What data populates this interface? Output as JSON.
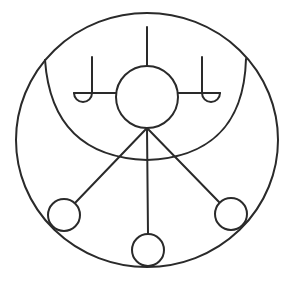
{
  "diagram": {
    "type": "symbolic-figure",
    "background": "#ffffff",
    "stroke_color": "#2a2a2a",
    "outer_circle": {
      "cx": 147,
      "cy": 140,
      "rx": 131,
      "ry": 127
    },
    "inner_arc": {
      "start": [
        45,
        60
      ],
      "end": [
        246,
        59
      ],
      "lowest_y": 160
    },
    "center_circle": {
      "cx": 147,
      "cy": 97,
      "r": 31
    },
    "top_stem": {
      "x": 147,
      "y1": 27,
      "y2": 66
    },
    "left_hook": {
      "stem_x": 92,
      "y_top": 57,
      "y_bottom": 93,
      "arm_to_x": 116,
      "cup_cx": 83,
      "cup_r": 9
    },
    "right_hook": {
      "stem_x": 202,
      "y_top": 57,
      "y_bottom": 93,
      "arm_from_x": 178,
      "cup_cx": 211,
      "cup_r": 9
    },
    "spokes_origin": [
      147,
      128
    ],
    "small_circles": [
      {
        "name": "left",
        "cx": 64,
        "cy": 215,
        "r": 16
      },
      {
        "name": "bottom",
        "cx": 148,
        "cy": 250,
        "r": 16
      },
      {
        "name": "right",
        "cx": 231,
        "cy": 214,
        "r": 16
      }
    ]
  }
}
